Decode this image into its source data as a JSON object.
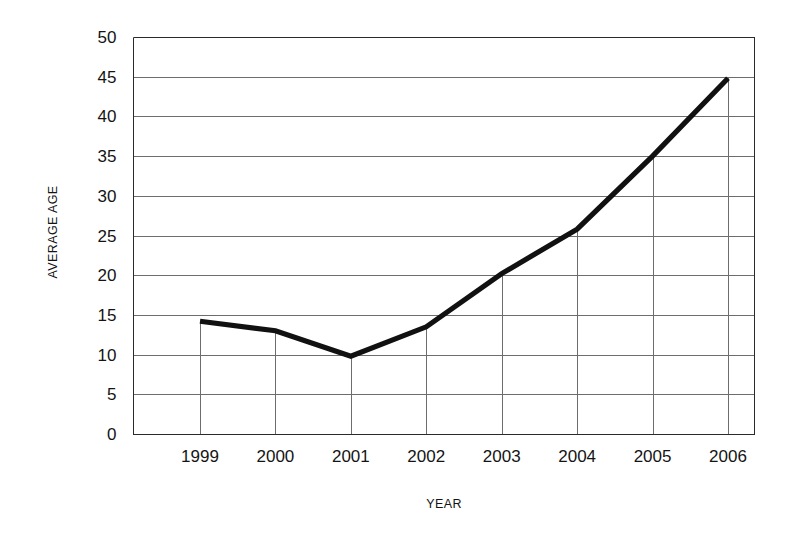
{
  "chart_data": {
    "type": "line",
    "title": "",
    "xlabel": "YEAR",
    "ylabel": "AVERAGE AGE",
    "categories": [
      "1999",
      "2000",
      "2001",
      "2002",
      "2003",
      "2004",
      "2005",
      "2006"
    ],
    "x": [
      1999,
      2000,
      2001,
      2002,
      2003,
      2004,
      2005,
      2006
    ],
    "values": [
      14.2,
      13.0,
      9.8,
      13.5,
      20.2,
      25.8,
      35.0,
      44.8
    ],
    "series": [
      {
        "name": "Average Age",
        "values": [
          14.2,
          13.0,
          9.8,
          13.5,
          20.2,
          25.8,
          35.0,
          44.8
        ]
      }
    ],
    "ylim": [
      0,
      50
    ],
    "ytick_values": [
      0,
      5,
      10,
      15,
      20,
      25,
      30,
      35,
      40,
      45,
      50
    ],
    "ytick_labels": [
      "0",
      "5",
      "10",
      "15",
      "20",
      "25",
      "30",
      "35",
      "40",
      "45",
      "50"
    ],
    "xtick_labels": [
      "1999",
      "2000",
      "2001",
      "2002",
      "2003",
      "2004",
      "2005",
      "2006"
    ],
    "grid": {
      "horizontal": true,
      "vertical_droplines": true
    },
    "legend": {
      "visible": false,
      "position": "none"
    },
    "line_color": "#111111",
    "grid_color": "#6d6d6d",
    "axis_color": "#2b2b2b",
    "background_color": "#ffffff"
  }
}
